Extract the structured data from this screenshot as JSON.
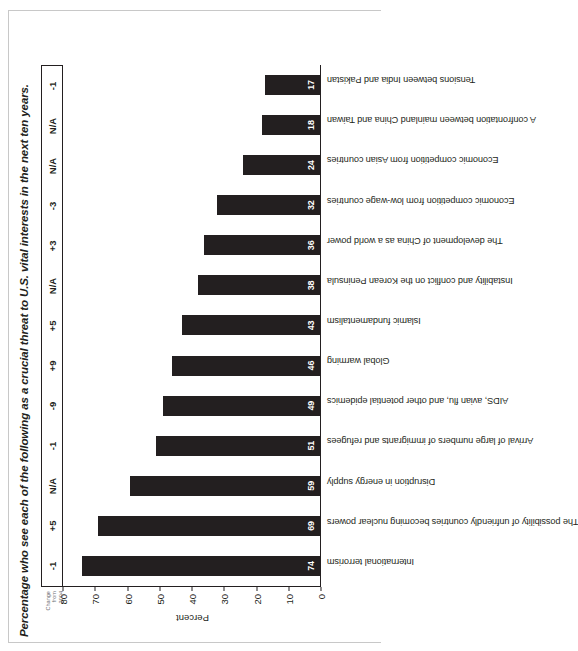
{
  "figure": {
    "title": "Percentage who see each of the following as a crucial threat to U.S. vital interests in the next ten years.",
    "change_header_line1": "Change",
    "change_header_line2": "from",
    "change_header_line3": "2004"
  },
  "chart_data": {
    "type": "bar",
    "title": "Percentage who see each of the following as a crucial threat to U.S. vital interests in the next ten years.",
    "xlabel": "",
    "ylabel": "Percent",
    "ylim": [
      0,
      80
    ],
    "yticks": [
      0,
      10,
      20,
      30,
      40,
      50,
      60,
      70,
      80
    ],
    "grid": false,
    "legend": "none",
    "orientation": "vertical",
    "bar_color": "#231f20",
    "categories": [
      "International terrorism",
      "The possibility of unfriendly countries becoming nuclear powers",
      "Disruption in energy supply",
      "Arrival of large numbers of immigrants and refugees",
      "AIDS, avian flu, and other potential epidemics",
      "Global warming",
      "Islamic fundamentalism",
      "Instability and conflict on the Korean Peninsula",
      "The development of China as a world power",
      "Economic competition from low-wage countries",
      "Economic competition from Asian countries",
      "A confrontation between mainland China and Taiwan",
      "Tensions between India and Pakistan"
    ],
    "values": [
      74,
      69,
      59,
      51,
      49,
      46,
      43,
      38,
      36,
      32,
      24,
      18,
      17
    ],
    "annotations": {
      "name": "Change from 2004",
      "values": [
        "-1",
        "+5",
        "N/A",
        "-1",
        "-9",
        "+9",
        "+5",
        "N/A",
        "+3",
        "-3",
        "N/A",
        "N/A",
        "-1"
      ]
    }
  }
}
